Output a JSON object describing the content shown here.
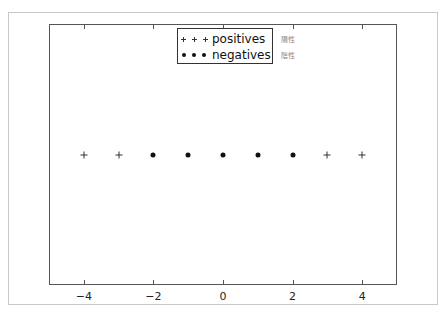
{
  "chart_data": {
    "type": "scatter",
    "title": "",
    "xlabel": "",
    "ylabel": "",
    "xlim": [
      -5,
      5
    ],
    "ylim": [
      -1,
      1
    ],
    "grid": false,
    "legend_position": "upper center",
    "x_ticks": [
      -4,
      -2,
      0,
      2,
      4
    ],
    "x_tick_labels": [
      "−4",
      "−2",
      "0",
      "2",
      "4"
    ],
    "y_ticks": [],
    "series": [
      {
        "name": "positives",
        "marker": "+",
        "x": [
          -4,
          -3,
          3,
          4
        ],
        "y": [
          0,
          0,
          0,
          0
        ]
      },
      {
        "name": "negatives",
        "marker": "o",
        "x": [
          -2,
          -1,
          0,
          1,
          2
        ],
        "y": [
          0,
          0,
          0,
          0,
          0
        ]
      }
    ],
    "annotations": [
      "陽性",
      "陰性"
    ]
  },
  "legend": {
    "items": [
      {
        "label": "positives",
        "marker": "plus-icon"
      },
      {
        "label": "negatives",
        "marker": "dot-icon"
      }
    ]
  },
  "side_labels": [
    "陽性",
    "陰性"
  ]
}
